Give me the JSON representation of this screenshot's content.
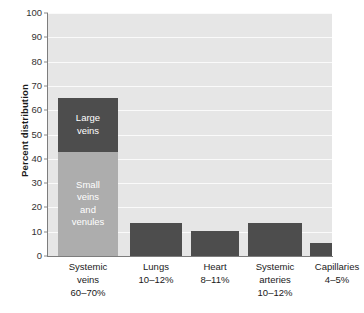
{
  "chart_data": {
    "type": "bar",
    "title": "",
    "xlabel": "",
    "ylabel": "Percent distribution",
    "ylim": [
      0,
      100
    ],
    "ytick_step": 10,
    "yticks": [
      100,
      90,
      80,
      70,
      60,
      50,
      40,
      30,
      20,
      10,
      0
    ],
    "grid": true,
    "legend": "none",
    "stacked_first_bar": true,
    "categories": [
      "Systemic veins",
      "Lungs",
      "Heart",
      "Systemic arteries",
      "Capillaries"
    ],
    "category_labels": [
      {
        "name": "Systemic",
        "name2": "veins",
        "range": "60–70%"
      },
      {
        "name": "Lungs",
        "name2": "",
        "range": "10–12%"
      },
      {
        "name": "Heart",
        "name2": "",
        "range": "8–11%"
      },
      {
        "name": "Systemic",
        "name2": "arteries",
        "range": "10–12%"
      },
      {
        "name": "Capillaries",
        "name2": "",
        "range": "4–5%"
      }
    ],
    "values": [
      65,
      13.5,
      10.5,
      13.5,
      5.5
    ],
    "segments": [
      {
        "label": "Small veins and venules",
        "label_lines": [
          "Small",
          "veins",
          "and",
          "venules"
        ],
        "value": 43,
        "color": "#adadad"
      },
      {
        "label": "Large veins",
        "label_lines": [
          "Large",
          "veins"
        ],
        "value": 22,
        "color": "#4d4d4d"
      }
    ],
    "bar_color": "#4d4d4d",
    "plot_background": "#e6e6e6",
    "gridline_color": "#fafafa",
    "axis_color": "#7d7d7d"
  },
  "axis": {
    "y_title": "Percent distribution"
  }
}
